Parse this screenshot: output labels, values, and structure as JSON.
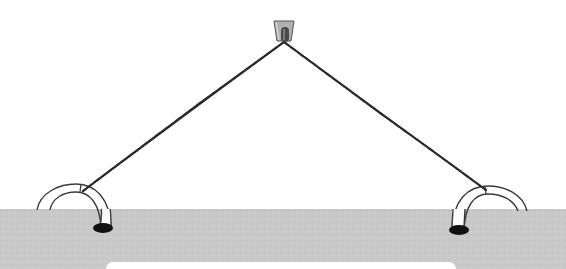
{
  "diagram": {
    "colors": {
      "background": "#ffffff",
      "ground": "#c9c9c9",
      "ground_texture": "#bdbdbd",
      "rope": "#2b2b2b",
      "hook_outline": "#3a3a3a",
      "hook_fill": "#ffffff",
      "hole": "#111111",
      "anchor_body": "#a8a8a8",
      "anchor_post": "#4a4a4a",
      "bottom_strip": "#ffffff"
    },
    "elements": {
      "top_anchor": {
        "label": "ceiling anchor",
        "x": 284,
        "y": 31
      },
      "left_hook": {
        "label": "left ground hook",
        "hole_x": 102,
        "hole_y": 228
      },
      "right_hook": {
        "label": "right ground hook",
        "hole_x": 459,
        "hole_y": 230
      },
      "left_rope": {
        "label": "left rope segment",
        "from": [
          284,
          42
        ],
        "to": [
          83,
          192
        ]
      },
      "right_rope": {
        "label": "right rope segment",
        "from": [
          284,
          42
        ],
        "to": [
          486,
          190
        ]
      },
      "ground": {
        "label": "ground slab",
        "top_y": 209
      }
    }
  }
}
